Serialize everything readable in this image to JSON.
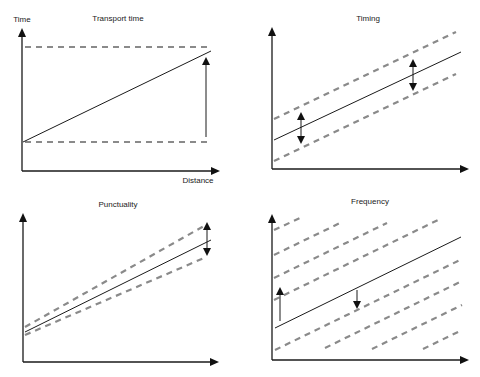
{
  "panels": [
    {
      "id": "transport-time",
      "title": "Transport time",
      "y_label": "Time",
      "x_label": "Distance",
      "description": "Solid line rising with distance between two horizontal dashed bounds; vertical arrow shows transport time growth"
    },
    {
      "id": "timing",
      "title": "Timing",
      "y_label": "",
      "x_label": "",
      "description": "Solid line with parallel dashed band above and below; double arrows show constant spread"
    },
    {
      "id": "punctuality",
      "title": "Punctuality",
      "y_label": "",
      "x_label": "",
      "description": "Solid line with diverging dashed lines; double arrow at right shows spread growing"
    },
    {
      "id": "frequency",
      "title": "Frequency",
      "y_label": "",
      "x_label": "",
      "description": "Solid line among many parallel dashed lines (departures); up and down arrows"
    }
  ],
  "colors": {
    "solid_line": "#1a1a1a",
    "dashed_line": "#8a8a8a",
    "background": "#ffffff"
  }
}
